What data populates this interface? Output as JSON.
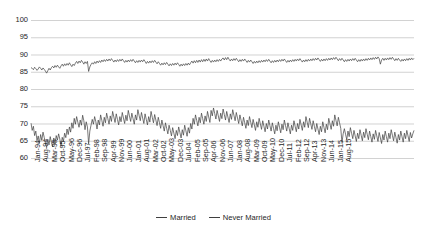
{
  "chart_data": {
    "type": "line",
    "title": "",
    "xlabel": "",
    "ylabel": "",
    "ylim": [
      60,
      100
    ],
    "ytick_step": 5,
    "yticks": [
      100,
      95,
      90,
      85,
      80,
      75,
      70,
      65,
      60
    ],
    "grid": "horizontal",
    "legend_position": "bottom-center",
    "x_tick_interval_months": 7,
    "x_start": "Jan-94",
    "x_end": "Aug-15",
    "xticks": [
      "Jan-94",
      "Aug-94",
      "Mar-95",
      "Oct-95",
      "May-96",
      "Dec-96",
      "Jul-97",
      "Feb-98",
      "Sep-98",
      "Apr-99",
      "Nov-99",
      "Jun-00",
      "Jan-01",
      "Aug-01",
      "Mar-02",
      "Oct-02",
      "May-03",
      "Dec-03",
      "Jul-04",
      "Feb-05",
      "Sep-05",
      "Apr-06",
      "Nov-06",
      "Jun-07",
      "Jan-08",
      "Aug-08",
      "Mar-09",
      "Oct-09",
      "May-10",
      "Dec-10",
      "Jul-11",
      "Feb-12",
      "Sep-12",
      "Apr-13",
      "Nov-13",
      "Jun-14",
      "Jan-15",
      "Aug-15"
    ],
    "series": [
      {
        "name": "Married",
        "color": "#3f3f3f",
        "values": [
          86.2,
          86.0,
          85.6,
          86.3,
          85.9,
          85.4,
          85.8,
          86.4,
          86.0,
          85.5,
          86.1,
          85.7,
          85.2,
          84.6,
          85.3,
          86.0,
          85.5,
          86.2,
          86.6,
          86.1,
          86.8,
          86.3,
          86.9,
          86.4,
          86.0,
          86.7,
          87.2,
          86.6,
          87.3,
          86.8,
          87.4,
          86.9,
          87.6,
          87.0,
          86.5,
          87.2,
          86.8,
          87.5,
          88.0,
          87.4,
          88.1,
          87.6,
          88.3,
          87.8,
          87.2,
          87.9,
          87.4,
          88.0,
          85.1,
          86.4,
          87.1,
          87.6,
          87.2,
          87.9,
          87.4,
          88.1,
          87.6,
          88.2,
          87.7,
          88.4,
          87.9,
          88.5,
          88.0,
          88.6,
          88.1,
          88.7,
          88.2,
          88.8,
          88.3,
          87.8,
          88.4,
          87.9,
          88.5,
          88.0,
          88.6,
          88.1,
          88.7,
          88.2,
          87.7,
          88.3,
          87.8,
          88.4,
          87.9,
          88.5,
          88.0,
          88.6,
          88.1,
          87.6,
          88.2,
          87.7,
          88.3,
          87.8,
          88.4,
          87.9,
          88.5,
          88.0,
          87.4,
          88.0,
          87.5,
          88.1,
          87.6,
          88.2,
          87.7,
          88.3,
          87.8,
          87.3,
          87.9,
          87.4,
          86.9,
          87.5,
          87.0,
          87.6,
          87.1,
          87.7,
          87.2,
          86.7,
          87.3,
          86.8,
          87.4,
          86.9,
          87.5,
          87.0,
          87.6,
          87.1,
          86.6,
          87.2,
          86.7,
          87.3,
          86.8,
          87.4,
          86.9,
          87.5,
          87.0,
          87.6,
          88.1,
          87.5,
          88.2,
          87.6,
          88.3,
          87.7,
          88.4,
          87.8,
          88.5,
          87.9,
          88.6,
          88.0,
          88.7,
          88.1,
          88.8,
          88.2,
          87.7,
          88.3,
          87.8,
          88.4,
          87.9,
          88.5,
          88.0,
          88.6,
          88.1,
          88.7,
          89.0,
          88.4,
          89.1,
          88.5,
          89.2,
          88.6,
          88.1,
          88.7,
          88.2,
          88.8,
          88.3,
          88.9,
          88.4,
          87.9,
          88.5,
          88.0,
          88.6,
          88.1,
          88.7,
          88.2,
          87.7,
          88.3,
          87.8,
          88.4,
          87.9,
          87.4,
          88.0,
          87.5,
          88.1,
          87.6,
          88.2,
          87.7,
          88.3,
          87.8,
          88.4,
          87.9,
          88.5,
          88.0,
          88.6,
          88.1,
          87.6,
          88.2,
          87.7,
          88.3,
          87.8,
          88.4,
          87.9,
          88.5,
          88.0,
          88.6,
          88.1,
          88.7,
          88.2,
          87.7,
          88.3,
          87.8,
          88.4,
          87.9,
          88.5,
          88.0,
          88.6,
          88.1,
          88.7,
          88.2,
          88.8,
          88.3,
          87.8,
          88.4,
          87.9,
          88.5,
          88.0,
          88.6,
          88.1,
          88.7,
          88.2,
          88.8,
          88.3,
          88.9,
          88.4,
          89.0,
          88.5,
          88.0,
          88.6,
          88.1,
          88.7,
          88.2,
          88.8,
          88.3,
          88.9,
          88.4,
          89.0,
          88.5,
          89.1,
          88.6,
          89.2,
          88.7,
          88.2,
          88.8,
          88.3,
          88.9,
          88.4,
          87.9,
          88.5,
          88.0,
          88.6,
          88.1,
          88.7,
          88.2,
          88.8,
          88.3,
          88.9,
          88.4,
          87.9,
          88.5,
          88.0,
          88.6,
          88.1,
          88.7,
          88.2,
          88.8,
          88.3,
          88.9,
          88.4,
          89.0,
          88.5,
          89.1,
          88.6,
          89.2,
          88.7,
          89.3,
          88.8,
          87.2,
          88.4,
          88.9,
          88.3,
          88.9,
          88.4,
          89.0,
          88.5,
          89.1,
          88.6,
          89.2,
          88.7,
          88.2,
          88.8,
          88.3,
          88.9,
          88.4,
          88.0,
          88.6,
          88.1,
          88.7,
          88.2,
          88.8,
          88.3,
          88.9,
          88.4,
          89.0,
          88.5,
          88.9
        ]
      },
      {
        "name": "Never Married",
        "color": "#3f3f3f",
        "values": [
          70.1,
          68.0,
          69.2,
          66.5,
          67.8,
          65.0,
          66.4,
          64.2,
          66.8,
          65.1,
          67.5,
          66.0,
          64.3,
          63.1,
          65.4,
          63.8,
          66.2,
          64.5,
          63.2,
          65.8,
          64.0,
          66.5,
          65.2,
          67.0,
          65.5,
          63.4,
          66.0,
          64.8,
          67.2,
          65.9,
          68.4,
          66.8,
          69.0,
          67.5,
          70.2,
          68.6,
          71.5,
          69.8,
          72.0,
          70.4,
          68.9,
          71.0,
          69.5,
          72.4,
          70.8,
          68.2,
          70.5,
          69.0,
          64.1,
          67.8,
          69.5,
          71.2,
          69.8,
          72.0,
          70.5,
          68.4,
          71.0,
          69.6,
          72.5,
          70.9,
          69.2,
          71.8,
          70.2,
          73.0,
          71.4,
          69.8,
          72.2,
          70.6,
          73.5,
          71.9,
          70.3,
          72.8,
          71.2,
          69.6,
          72.0,
          70.5,
          73.2,
          71.6,
          70.0,
          72.4,
          70.8,
          73.8,
          72.2,
          70.6,
          73.0,
          71.4,
          69.8,
          72.5,
          71.0,
          74.0,
          72.4,
          70.8,
          73.2,
          71.6,
          70.0,
          72.8,
          71.2,
          69.6,
          72.0,
          70.4,
          73.5,
          71.8,
          70.2,
          72.6,
          71.0,
          69.4,
          71.8,
          70.2,
          68.6,
          71.0,
          69.4,
          67.8,
          70.2,
          68.6,
          67.0,
          69.5,
          68.0,
          66.4,
          68.8,
          67.2,
          65.6,
          68.0,
          66.5,
          69.0,
          67.4,
          65.8,
          68.2,
          66.6,
          69.5,
          67.9,
          66.3,
          68.8,
          67.2,
          70.0,
          68.4,
          71.5,
          69.8,
          72.5,
          70.9,
          69.3,
          71.8,
          70.2,
          73.0,
          71.4,
          69.8,
          72.2,
          70.6,
          73.5,
          71.9,
          70.3,
          73.8,
          72.2,
          74.5,
          72.9,
          71.3,
          73.8,
          72.2,
          70.6,
          73.0,
          71.4,
          74.2,
          72.6,
          71.0,
          73.5,
          71.9,
          70.3,
          72.8,
          71.2,
          74.0,
          72.4,
          70.8,
          73.2,
          71.6,
          70.0,
          72.5,
          70.9,
          69.3,
          71.8,
          70.2,
          68.6,
          71.0,
          69.4,
          72.0,
          70.4,
          68.8,
          71.2,
          69.6,
          68.0,
          70.5,
          68.9,
          71.5,
          69.9,
          68.3,
          70.8,
          69.2,
          67.6,
          70.0,
          68.4,
          71.0,
          69.4,
          67.8,
          70.2,
          68.6,
          67.0,
          69.5,
          67.9,
          70.5,
          68.9,
          67.3,
          69.8,
          68.2,
          71.0,
          69.4,
          67.8,
          70.2,
          68.6,
          67.0,
          69.5,
          68.0,
          70.8,
          69.2,
          67.6,
          70.0,
          68.4,
          71.2,
          69.6,
          68.0,
          70.5,
          68.9,
          72.0,
          70.4,
          68.8,
          71.5,
          69.9,
          68.3,
          70.8,
          69.2,
          67.6,
          70.0,
          68.4,
          66.8,
          69.2,
          67.6,
          70.5,
          68.9,
          67.3,
          69.8,
          68.2,
          71.5,
          69.9,
          68.3,
          70.8,
          69.2,
          72.5,
          70.9,
          69.3,
          71.8,
          70.2,
          68.6,
          64.5,
          67.0,
          68.5,
          66.9,
          65.3,
          67.8,
          66.2,
          68.8,
          67.2,
          65.6,
          68.0,
          66.4,
          64.8,
          67.2,
          65.6,
          68.2,
          66.6,
          65.0,
          67.5,
          65.9,
          68.5,
          66.9,
          65.3,
          67.8,
          66.2,
          64.6,
          67.0,
          65.4,
          68.0,
          66.4,
          64.8,
          67.4,
          65.8,
          64.2,
          66.8,
          65.2,
          67.8,
          66.2,
          64.6,
          67.2,
          65.6,
          68.2,
          66.6,
          65.0,
          67.5,
          65.9,
          64.3,
          66.8,
          65.2,
          67.8,
          66.2,
          64.6,
          67.2,
          65.6,
          68.0,
          66.4,
          64.8,
          67.4,
          65.8,
          67.0,
          68.0
        ]
      }
    ]
  },
  "legend": {
    "entries": [
      {
        "label": "Married"
      },
      {
        "label": "Never Married"
      }
    ]
  }
}
